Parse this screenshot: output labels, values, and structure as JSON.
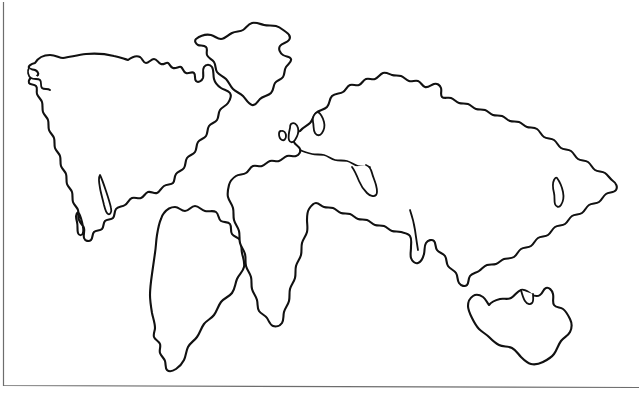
{
  "figure": {
    "background_color": "#ffffff",
    "outline_color": "#111111",
    "frame_color": "#6d6d6d",
    "width": 639,
    "height": 402,
    "style": "blank political world map, continents drawn as black outlines only, no labels, no fills"
  },
  "frame": {
    "left_edge_x": 3,
    "bottom_edge_y": 385,
    "description": "thin grey rule along left side and bottom of the drawing"
  },
  "landmasses": [
    {
      "id": "north-america",
      "label": "North America",
      "bbox": [
        28,
        52,
        232,
        232
      ],
      "notes": "includes Alaska at upper left, Hudson Bay notch, Florida and Baja peninsulas, tapering into Central America"
    },
    {
      "id": "greenland",
      "label": "Greenland",
      "bbox": [
        185,
        18,
        292,
        107
      ],
      "notes": "separate island north-east of North America"
    },
    {
      "id": "south-america",
      "label": "South America",
      "bbox": [
        148,
        198,
        243,
        372
      ],
      "notes": "wide northern bulge narrowing to a southern tip near y=370"
    },
    {
      "id": "eurasia-africa",
      "label": "Eurasia and Africa",
      "bbox": [
        255,
        72,
        617,
        330
      ],
      "notes": "single continuous outline: Europe with Scandinavia and British Isles, Africa with southern cape near y=327, Arabian peninsula, India, South-East Asia, and Siberia reaching the far east near x=615"
    },
    {
      "id": "british-isles",
      "label": "British Isles",
      "bbox": [
        279,
        120,
        300,
        148
      ],
      "notes": "small island pair off north-west Europe"
    },
    {
      "id": "australia",
      "label": "Australia",
      "bbox": [
        464,
        287,
        572,
        366
      ],
      "notes": "isolated landmass in the lower right quadrant"
    }
  ]
}
